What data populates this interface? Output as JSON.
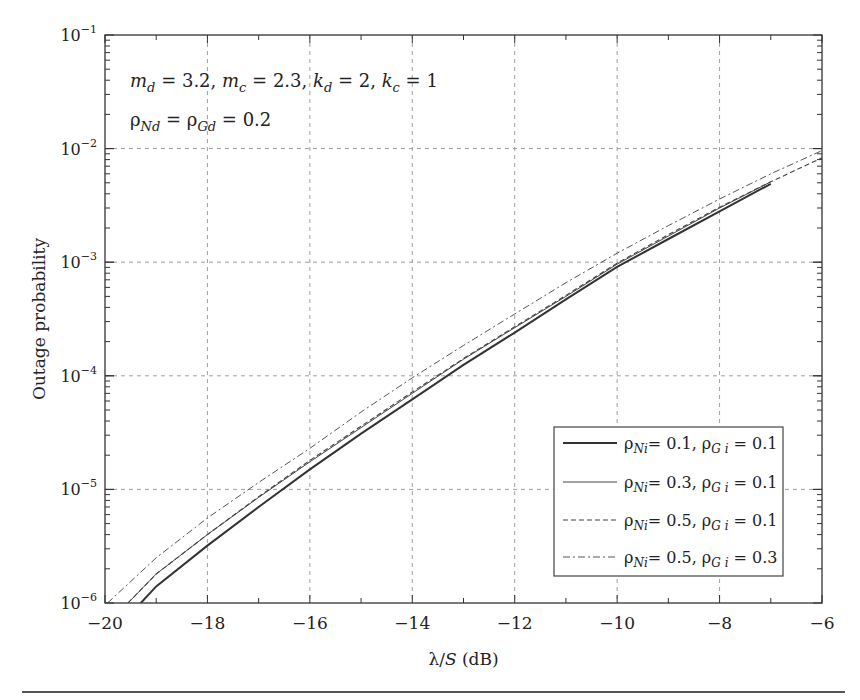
{
  "chart_data": {
    "type": "line",
    "title": "",
    "xlabel": "λ/S (dB)",
    "ylabel": "Outage probability",
    "xscale": "linear",
    "yscale": "log",
    "xlim": [
      -20,
      -6
    ],
    "ylim": [
      1e-06,
      0.1
    ],
    "xticks": [
      -20,
      -18,
      -16,
      -14,
      -12,
      -10,
      -8,
      -6
    ],
    "xtick_labels": [
      "−20",
      "−18",
      "−16",
      "−14",
      "−12",
      "−10",
      "−8",
      "−6"
    ],
    "yticks": [
      1e-06,
      1e-05,
      0.0001,
      0.001,
      0.01,
      0.1
    ],
    "ytick_labels": [
      {
        "base": "10",
        "exp": "−6"
      },
      {
        "base": "10",
        "exp": "−5"
      },
      {
        "base": "10",
        "exp": "−4"
      },
      {
        "base": "10",
        "exp": "−3"
      },
      {
        "base": "10",
        "exp": "−2"
      },
      {
        "base": "10",
        "exp": "−1"
      }
    ],
    "grid": true,
    "legend_position": "lower right",
    "annotations": [
      {
        "text_parts": [
          {
            "t": "m",
            "i": true
          },
          {
            "t": "d",
            "sub": true,
            "i": true
          },
          {
            "t": " = 3.2, "
          },
          {
            "t": "m",
            "i": true
          },
          {
            "t": "c",
            "sub": true,
            "i": true
          },
          {
            "t": " = 2.3, "
          },
          {
            "t": "k",
            "i": true
          },
          {
            "t": "d",
            "sub": true,
            "i": true
          },
          {
            "t": " = 2, "
          },
          {
            "t": "k",
            "i": true
          },
          {
            "t": "c",
            "sub": true,
            "i": true
          },
          {
            "t": " = 1"
          }
        ],
        "plain": "m_d = 3.2, m_c = 2.3, k_d = 2, k_c = 1"
      },
      {
        "text_parts": [
          {
            "t": "ρ"
          },
          {
            "t": "Nd",
            "sub": true,
            "i": true
          },
          {
            "t": " = ρ"
          },
          {
            "t": "Gd",
            "sub": true,
            "i": true
          },
          {
            "t": " = 0.2"
          }
        ],
        "plain": "ρ_Nd = ρ_Gd = 0.2"
      }
    ],
    "series": [
      {
        "name": "ρ_Ni = 0.1, ρ_Gi = 0.1",
        "label_parts": {
          "a": "0.1",
          "b": "0.1"
        },
        "style": "solid",
        "width": 2.0,
        "color": "#333333",
        "x": [
          -19.3,
          -19,
          -18,
          -17,
          -16,
          -15,
          -14,
          -13,
          -12,
          -11,
          -10,
          -9,
          -8,
          -7
        ],
        "y": [
          1e-06,
          1.4e-06,
          3.2e-06,
          7e-06,
          1.5e-05,
          3.1e-05,
          6.2e-05,
          0.000125,
          0.00024,
          0.00047,
          0.00091,
          0.0016,
          0.0028,
          0.0049
        ]
      },
      {
        "name": "ρ_Ni = 0.3, ρ_Gi = 0.1",
        "label_parts": {
          "a": "0.3",
          "b": "0.1"
        },
        "style": "thin",
        "width": 1.0,
        "color": "#444444",
        "x": [
          -19.55,
          -19,
          -18,
          -17,
          -16,
          -15,
          -14,
          -13,
          -12,
          -11,
          -10,
          -9,
          -8,
          -7
        ],
        "y": [
          1e-06,
          1.8e-06,
          4e-06,
          8.5e-06,
          1.75e-05,
          3.5e-05,
          7e-05,
          0.00014,
          0.000265,
          0.0005,
          0.00096,
          0.0017,
          0.003,
          0.0051
        ]
      },
      {
        "name": "ρ_Ni = 0.5, ρ_Gi = 0.1",
        "label_parts": {
          "a": "0.5",
          "b": "0.1"
        },
        "style": "dashed",
        "width": 1.1,
        "color": "#444444",
        "x": [
          -19.55,
          -19,
          -18,
          -17,
          -16,
          -15,
          -14,
          -13,
          -12,
          -11,
          -10,
          -9,
          -8,
          -7,
          -6
        ],
        "y": [
          1e-06,
          1.8e-06,
          4e-06,
          8.6e-06,
          1.8e-05,
          3.6e-05,
          7.2e-05,
          0.000142,
          0.00027,
          0.00051,
          0.00098,
          0.00175,
          0.00305,
          0.0051,
          0.0083
        ]
      },
      {
        "name": "ρ_Ni = 0.5, ρ_Gi = 0.3",
        "label_parts": {
          "a": "0.5",
          "b": "0.3"
        },
        "style": "dashdot",
        "width": 1.0,
        "color": "#555555",
        "x": [
          -19.95,
          -19,
          -18,
          -17,
          -16,
          -15,
          -14,
          -13,
          -12,
          -11,
          -10,
          -9,
          -8,
          -7,
          -6
        ],
        "y": [
          1e-06,
          2.5e-06,
          5.6e-06,
          1.15e-05,
          2.3e-05,
          4.8e-05,
          9.6e-05,
          0.000185,
          0.00035,
          0.00066,
          0.0012,
          0.0021,
          0.0036,
          0.006,
          0.0096
        ]
      }
    ]
  }
}
